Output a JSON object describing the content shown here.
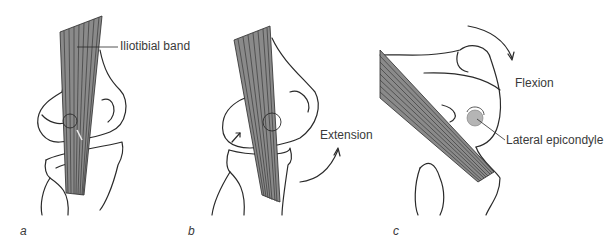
{
  "figure": {
    "panels": [
      {
        "letter": "a",
        "labels": [
          "Iliotibial band"
        ]
      },
      {
        "letter": "b",
        "labels": [
          "Extension"
        ]
      },
      {
        "letter": "c",
        "labels": [
          "Flexion",
          "Lateral epicondyle"
        ]
      }
    ],
    "colors": {
      "band": "#8a8a8a",
      "outline": "#2a2a2a",
      "epicondyle": "#b5b5b5",
      "text": "#3a3a3a"
    }
  }
}
